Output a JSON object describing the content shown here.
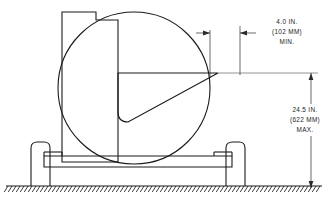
{
  "drawing": {
    "title": "Hose Reel Cart Side Elevation",
    "background_color": "#ffffff",
    "line_color": "#1a1a1a",
    "dimension_color": "#2b2b2b"
  },
  "dimensions": {
    "horizontal": {
      "name": "nozzle-projection",
      "line1": "4.0 IN.",
      "line2": "(102 MM)",
      "line3": "MIN."
    },
    "vertical": {
      "name": "nozzle-height",
      "line1": "24.5 IN.",
      "line2": "(622 MM)",
      "line3": "MAX."
    }
  },
  "components": {
    "reel_drum": "hose-reel-drum",
    "cart_body": "cart-body-frame",
    "nozzle": "nozzle-wedge",
    "left_wheel": "left-wheel",
    "right_wheel": "right-wheel",
    "base_rail": "base-rail",
    "ground": "ground-hatching"
  }
}
